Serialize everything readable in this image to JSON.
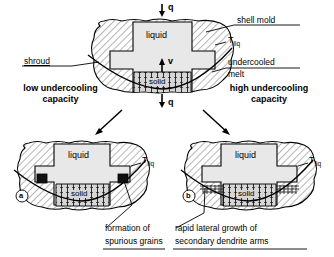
{
  "figure": {
    "type": "schematic-diagram"
  },
  "top_diagram": {
    "region_liquid": "liquid",
    "region_solid": "solid",
    "heat_flux_top": "q",
    "heat_flux_bottom": "q",
    "growth_velocity": "v",
    "label_shell_mold": "shell mold",
    "label_shroud": "shroud",
    "label_tliq_main": "T",
    "label_tliq_sub": "liq",
    "label_undercooled_1": "undercooled",
    "label_undercooled_2": "melt"
  },
  "branches": {
    "left_1": "low undercooling",
    "left_2": "capacity",
    "right_1": "high undercooling",
    "right_2": "capacity"
  },
  "panel_a": {
    "tag": "a",
    "region_liquid": "liquid",
    "region_solid": "solid",
    "label_tliq_main": "T",
    "label_tliq_sub": "liq",
    "caption_1": "formation of",
    "caption_2": "spurious grains"
  },
  "panel_b": {
    "tag": "b",
    "region_liquid": "liquid",
    "region_solid": "solid",
    "label_tliq_main": "T",
    "label_tliq_sub": "liq",
    "caption_1": "rapid lateral growth of",
    "caption_2": "secondary dendrite arms"
  },
  "colors": {
    "stroke": "#000000",
    "liquid_fill": "#e8e8e8",
    "solid_fill": "#d6d6d6",
    "mold_fill": "#ffffff",
    "background": "#ffffff"
  }
}
